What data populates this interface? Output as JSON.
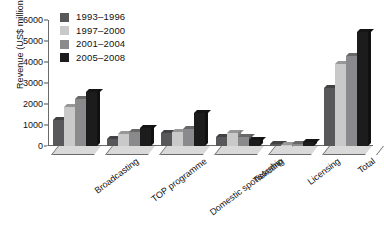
{
  "chart_data": {
    "type": "bar",
    "title": "",
    "subtitle": "",
    "xlabel": "",
    "ylabel": "Revenue (US$ million)",
    "ylim": [
      0,
      6000
    ],
    "yticks": [
      0,
      1000,
      2000,
      3000,
      4000,
      5000,
      6000
    ],
    "ytick_labels": [
      "0",
      "1000",
      "2000",
      "3000",
      "4000",
      "5000",
      "6000"
    ],
    "grid": false,
    "legend_position": "top-left inside",
    "orientation": "vertical",
    "grouping": "clustered",
    "categories": [
      "Broadcasting",
      "TOP programme",
      "Domestic sponsorship",
      "Ticketing",
      "Licensing",
      "Total"
    ],
    "series": [
      {
        "name": "1993-1996",
        "color": "#58585a",
        "values": [
          1251,
          353,
          636,
          451,
          115,
          2750
        ]
      },
      {
        "name": "1997-2000",
        "color": "#c9c9c9",
        "values": [
          1845,
          579,
          655,
          625,
          66,
          3900
        ]
      },
      {
        "name": "2001-2004",
        "color": "#8a8a8c",
        "values": [
          2232,
          663,
          796,
          411,
          87,
          4300
        ]
      },
      {
        "name": "2005-2008",
        "color": "#1c1c1c",
        "values": [
          2570,
          866,
          1555,
          274,
          185,
          5450
        ]
      }
    ],
    "annotations": [],
    "axis_break": true
  },
  "axis": {
    "y_title": "Revenue (US$ million)"
  },
  "legend": {
    "entries": [
      {
        "label": "1993–1996",
        "color": "#58585a"
      },
      {
        "label": "1997–2000",
        "color": "#c9c9c9"
      },
      {
        "label": "2001–2004",
        "color": "#8a8a8c"
      },
      {
        "label": "2005–2008",
        "color": "#1c1c1c"
      }
    ]
  }
}
